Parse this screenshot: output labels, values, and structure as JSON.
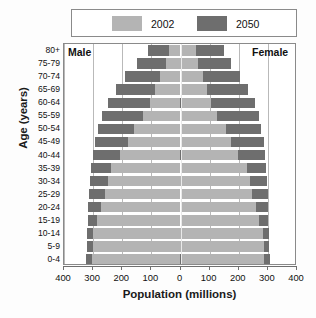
{
  "chart_data": {
    "type": "bar",
    "subtype": "population-pyramid",
    "title": "",
    "xlabel": "Population (millions)",
    "ylabel": "Age (years)",
    "xlim": [
      -400,
      400
    ],
    "xticks": [
      400,
      300,
      200,
      100,
      0,
      100,
      200,
      300,
      400
    ],
    "xtick_labels": [
      "400",
      "300",
      "200",
      "100",
      "0",
      "100",
      "200",
      "300",
      "400"
    ],
    "grid": true,
    "legend_position": "top",
    "side_labels": {
      "left": "Male",
      "right": "Female"
    },
    "colors": {
      "series_2002": "#b4b4b4",
      "series_2050": "#6e6e6e",
      "frame": "#8a8a8a",
      "gridline": "#b9b9b9"
    },
    "categories": [
      "0-4",
      "5-9",
      "10-14",
      "15-19",
      "20-24",
      "25-29",
      "30-34",
      "35-39",
      "40-44",
      "45-49",
      "50-54",
      "55-59",
      "60-64",
      "65-69",
      "70-74",
      "75-79",
      "80+"
    ],
    "series": [
      {
        "name": "2002",
        "color": "#b4b4b4",
        "male": [
          305,
          300,
          300,
          285,
          272,
          258,
          250,
          240,
          208,
          180,
          160,
          128,
          105,
          88,
          70,
          50,
          38
        ],
        "female": [
          288,
          285,
          282,
          268,
          258,
          245,
          238,
          228,
          198,
          172,
          155,
          126,
          105,
          92,
          78,
          60,
          52
        ]
      },
      {
        "name": "2050",
        "color": "#6e6e6e",
        "male": [
          325,
          322,
          320,
          318,
          318,
          315,
          312,
          308,
          300,
          292,
          282,
          268,
          250,
          222,
          190,
          150,
          110
        ],
        "female": [
          308,
          305,
          305,
          302,
          302,
          300,
          298,
          295,
          290,
          285,
          278,
          268,
          255,
          232,
          205,
          172,
          148
        ]
      }
    ]
  },
  "legend": {
    "items": [
      {
        "label": "2002",
        "color": "#b4b4b4"
      },
      {
        "label": "2050",
        "color": "#6e6e6e"
      }
    ]
  },
  "axes": {
    "ylabel": "Age (years)",
    "xlabel": "Population (millions)",
    "age_labels": [
      "80+",
      "75-79",
      "70-74",
      "65-69",
      "60-64",
      "55-59",
      "50-54",
      "45-49",
      "40-44",
      "35-39",
      "30-34",
      "25-29",
      "20-24",
      "15-19",
      "10-14",
      "5-9",
      "0-4"
    ],
    "xtick_labels": [
      "400",
      "300",
      "200",
      "100",
      "0",
      "100",
      "200",
      "300",
      "400"
    ]
  },
  "annotations": {
    "male": "Male",
    "female": "Female"
  }
}
